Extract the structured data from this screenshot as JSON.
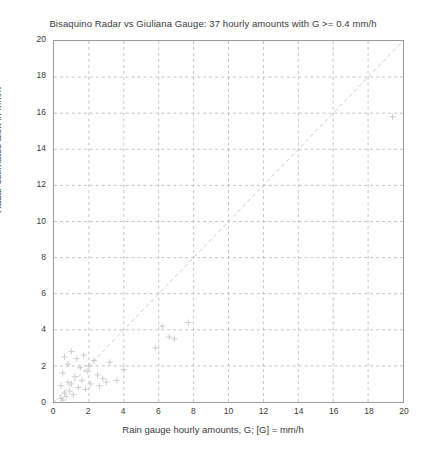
{
  "chart_data": {
    "type": "scatter",
    "title": "Bisaquino Radar vs Giuliana Gauge: 37 hourly amounts with G >= 0.4 mm/h",
    "xlabel": "Rain gauge hourly amounts, G; [G] = mm/h",
    "ylabel": "Radar estimates aloft in mm/h",
    "xlim": [
      0,
      20
    ],
    "ylim": [
      0,
      20
    ],
    "xticks": [
      0,
      2,
      4,
      6,
      8,
      10,
      12,
      14,
      16,
      18,
      20
    ],
    "yticks": [
      0,
      2,
      4,
      6,
      8,
      10,
      12,
      14,
      16,
      18,
      20
    ],
    "grid": true,
    "legend": "none",
    "marker": "plus",
    "marker_color": "#c8c8c8",
    "reference_line": {
      "label": "1:1 identity line",
      "style": "dashed",
      "color": "#c8c8c8",
      "from": [
        0,
        0
      ],
      "to": [
        20,
        20
      ]
    },
    "n_points": 37,
    "points": [
      [
        0.4,
        0.2
      ],
      [
        0.4,
        0.9
      ],
      [
        0.5,
        0.1
      ],
      [
        0.5,
        1.6
      ],
      [
        0.6,
        0.5
      ],
      [
        0.6,
        2.5
      ],
      [
        0.7,
        0.3
      ],
      [
        0.8,
        1.1
      ],
      [
        0.8,
        2.1
      ],
      [
        0.9,
        0.6
      ],
      [
        1.0,
        1.0
      ],
      [
        1.0,
        2.8
      ],
      [
        1.1,
        0.4
      ],
      [
        1.2,
        1.4
      ],
      [
        1.3,
        2.4
      ],
      [
        1.4,
        0.8
      ],
      [
        1.5,
        1.9
      ],
      [
        1.6,
        1.2
      ],
      [
        1.7,
        2.6
      ],
      [
        1.8,
        0.7
      ],
      [
        1.9,
        1.7
      ],
      [
        2.0,
        2.0
      ],
      [
        2.1,
        1.0
      ],
      [
        2.3,
        2.3
      ],
      [
        2.5,
        1.5
      ],
      [
        2.6,
        0.9
      ],
      [
        2.8,
        1.3
      ],
      [
        3.0,
        1.1
      ],
      [
        3.2,
        2.2
      ],
      [
        3.6,
        1.2
      ],
      [
        4.0,
        1.8
      ],
      [
        5.8,
        3.0
      ],
      [
        6.2,
        4.2
      ],
      [
        6.6,
        3.6
      ],
      [
        6.9,
        3.5
      ],
      [
        7.7,
        4.4
      ],
      [
        19.4,
        15.8
      ]
    ]
  }
}
